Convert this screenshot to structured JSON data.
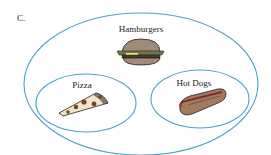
{
  "diagram": {
    "type": "venn",
    "panel_label": "C.",
    "outer_set": {
      "label": "Hamburgers",
      "icon": "hamburger-icon"
    },
    "inner_sets": [
      {
        "label": "Pizza",
        "icon": "pizza-slice-icon"
      },
      {
        "label": "Hot Dogs",
        "icon": "hot-dog-icon"
      }
    ],
    "colors": {
      "set_outline": "#4aa3c8",
      "text": "#222222"
    }
  }
}
